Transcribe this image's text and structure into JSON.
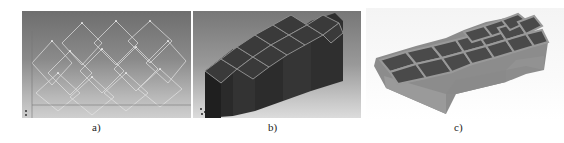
{
  "figure": {
    "panels": [
      {
        "id": "a",
        "label": "a)",
        "content": "CAD wireframe of cellular lattice"
      },
      {
        "id": "b",
        "label": "b)",
        "content": "3D solid render of lattice"
      },
      {
        "id": "c",
        "label": "c)",
        "content": "photo of printed lattice part"
      }
    ]
  },
  "colors": {
    "cad_background": "#8a8a8a",
    "wireframe": "#e8e8e8",
    "solid_body": "#2e2e2e",
    "solid_edges": "#9a9a9a",
    "printed_part": "#8f8f8f",
    "photo_background": "#f7f7f7"
  }
}
